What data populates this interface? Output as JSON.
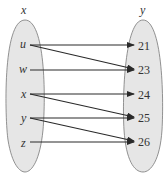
{
  "diagram": {
    "type": "mapping",
    "domain": {
      "label": "x",
      "elements": [
        "u",
        "w",
        "x",
        "y",
        "z"
      ]
    },
    "codomain": {
      "label": "y",
      "elements": [
        "21",
        "23",
        "24",
        "25",
        "26"
      ]
    },
    "arrows": [
      {
        "from": "u",
        "to": "21"
      },
      {
        "from": "u",
        "to": "23"
      },
      {
        "from": "w",
        "to": "23"
      },
      {
        "from": "x",
        "to": "24"
      },
      {
        "from": "x",
        "to": "25"
      },
      {
        "from": "y",
        "to": "25"
      },
      {
        "from": "y",
        "to": "26"
      },
      {
        "from": "z",
        "to": "26"
      }
    ],
    "colors": {
      "ellipse_fill": "#e6e6e6",
      "ellipse_stroke": "#777777",
      "arrow": "#2a2a2a"
    }
  }
}
